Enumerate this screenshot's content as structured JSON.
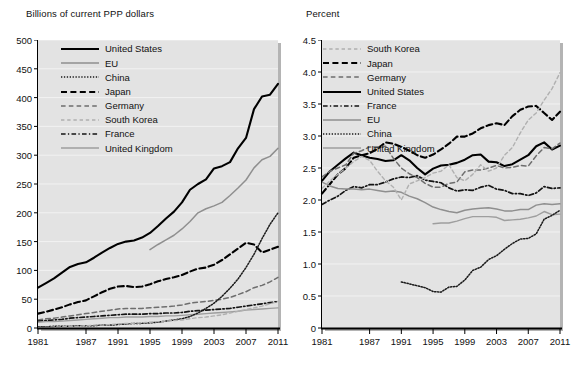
{
  "figure": {
    "background": "#ffffff",
    "plot_background": "#e3e3e3",
    "gridline_color": "#f2f2f2"
  },
  "left": {
    "title": "Billions of current PPP dollars",
    "legend": [
      {
        "label": "United States",
        "style": "solid-thick",
        "color": "#000000"
      },
      {
        "label": "EU",
        "style": "solid-thin",
        "color": "#8c8c8c"
      },
      {
        "label": "China",
        "style": "dotted",
        "color": "#000000"
      },
      {
        "label": "Japan",
        "style": "dashed-thick",
        "color": "#000000"
      },
      {
        "label": "Germany",
        "style": "dashed-thin",
        "color": "#6e6e6e"
      },
      {
        "label": "South Korea",
        "style": "dashed-light",
        "color": "#a8a8a8"
      },
      {
        "label": "France",
        "style": "dash-dot",
        "color": "#000000"
      },
      {
        "label": "United Kingdom",
        "style": "solid-gray",
        "color": "#9a9a9a"
      }
    ]
  },
  "right": {
    "title": "Percent",
    "legend": [
      {
        "label": "South Korea",
        "style": "dashed-light",
        "color": "#a8a8a8"
      },
      {
        "label": "Japan",
        "style": "dashed-thick",
        "color": "#000000"
      },
      {
        "label": "Germany",
        "style": "dashed-thin",
        "color": "#6e6e6e"
      },
      {
        "label": "United States",
        "style": "solid-thick",
        "color": "#000000"
      },
      {
        "label": "France",
        "style": "dash-dot",
        "color": "#000000"
      },
      {
        "label": "EU",
        "style": "solid-thin",
        "color": "#8c8c8c"
      },
      {
        "label": "China",
        "style": "dotted",
        "color": "#000000"
      },
      {
        "label": "United Kingdom",
        "style": "solid-gray",
        "color": "#9a9a9a"
      }
    ]
  },
  "chart_data": [
    {
      "type": "line",
      "panel": "left",
      "title": "Billions of current PPP dollars",
      "xlabel": "",
      "ylabel": "Billions of current PPP dollars",
      "xlim": [
        1981,
        2011
      ],
      "ylim": [
        0,
        500
      ],
      "yticks": [
        0,
        50,
        100,
        150,
        200,
        250,
        300,
        350,
        400,
        450,
        500
      ],
      "xticks": [
        1981,
        1987,
        1991,
        1995,
        1999,
        2003,
        2007,
        2011
      ],
      "xtick_labels": [
        "1981",
        "1987",
        "1991",
        "1995",
        "1999",
        "2003",
        "2007",
        "2011"
      ],
      "ytick_labels": [
        "0",
        "50",
        "100",
        "150",
        "200",
        "250",
        "300",
        "350",
        "400",
        "450",
        "500"
      ],
      "grid": true,
      "legend_position": "upper-left",
      "x": [
        1981,
        1982,
        1983,
        1984,
        1985,
        1986,
        1987,
        1988,
        1989,
        1990,
        1991,
        1992,
        1993,
        1994,
        1995,
        1996,
        1997,
        1998,
        1999,
        2000,
        2001,
        2002,
        2003,
        2004,
        2005,
        2006,
        2007,
        2008,
        2009,
        2010,
        2011
      ],
      "series": [
        {
          "name": "United States",
          "style": "solid-thick",
          "values": [
            70,
            78,
            86,
            96,
            106,
            111,
            114,
            122,
            131,
            139,
            146,
            150,
            152,
            157,
            165,
            177,
            190,
            202,
            218,
            240,
            250,
            258,
            277,
            281,
            288,
            312,
            330,
            380,
            402,
            405,
            424
          ]
        },
        {
          "name": "EU",
          "style": "solid-thin",
          "x_start": 1995,
          "values": [
            null,
            null,
            null,
            null,
            null,
            null,
            null,
            null,
            null,
            null,
            null,
            null,
            null,
            null,
            136,
            145,
            153,
            161,
            172,
            185,
            200,
            207,
            212,
            218,
            230,
            243,
            257,
            278,
            292,
            298,
            312
          ]
        },
        {
          "name": "Japan",
          "style": "dashed-thick",
          "values": [
            25,
            28,
            32,
            36,
            41,
            45,
            48,
            55,
            62,
            68,
            72,
            73,
            71,
            72,
            76,
            81,
            85,
            88,
            92,
            98,
            103,
            105,
            110,
            118,
            128,
            138,
            148,
            145,
            131,
            136,
            141
          ]
        },
        {
          "name": "Germany",
          "style": "dashed-thin",
          "values": [
            14,
            16,
            17,
            19,
            21,
            23,
            25,
            27,
            29,
            31,
            33,
            34,
            34,
            34,
            35,
            36,
            37,
            38,
            40,
            43,
            45,
            46,
            48,
            50,
            53,
            58,
            63,
            70,
            74,
            80,
            88
          ]
        },
        {
          "name": "France",
          "style": "dash-dot",
          "values": [
            12,
            13,
            14,
            15,
            17,
            18,
            19,
            20,
            21,
            22,
            23,
            24,
            24,
            24,
            25,
            25,
            26,
            26,
            27,
            29,
            30,
            31,
            32,
            33,
            34,
            36,
            38,
            40,
            42,
            44,
            46
          ]
        },
        {
          "name": "United Kingdom",
          "style": "solid-gray",
          "values": [
            10,
            11,
            11,
            12,
            13,
            14,
            15,
            16,
            17,
            18,
            18,
            19,
            19,
            19,
            20,
            20,
            21,
            21,
            22,
            23,
            24,
            25,
            26,
            27,
            28,
            29,
            31,
            32,
            33,
            34,
            35
          ]
        },
        {
          "name": "China",
          "style": "dotted",
          "values": [
            2,
            2,
            3,
            3,
            3,
            4,
            4,
            4,
            5,
            5,
            6,
            7,
            8,
            8,
            9,
            10,
            12,
            14,
            16,
            20,
            26,
            34,
            43,
            55,
            69,
            85,
            105,
            128,
            155,
            180,
            200
          ]
        },
        {
          "name": "South Korea",
          "style": "dashed-light",
          "values": [
            1,
            1,
            2,
            2,
            3,
            3,
            4,
            5,
            5,
            6,
            7,
            8,
            8,
            9,
            10,
            11,
            12,
            13,
            14,
            16,
            18,
            19,
            21,
            23,
            26,
            29,
            32,
            35,
            38,
            42,
            46
          ]
        }
      ]
    },
    {
      "type": "line",
      "panel": "right",
      "title": "Percent",
      "xlabel": "",
      "ylabel": "Percent",
      "xlim": [
        1981,
        2011
      ],
      "ylim": [
        0,
        4.5
      ],
      "yticks": [
        0,
        0.5,
        1.0,
        1.5,
        2.0,
        2.5,
        3.0,
        3.5,
        4.0,
        4.5
      ],
      "xticks": [
        1981,
        1987,
        1991,
        1995,
        1999,
        2003,
        2007,
        2011
      ],
      "xtick_labels": [
        "1981",
        "1987",
        "1991",
        "1995",
        "1999",
        "2003",
        "2007",
        "2011"
      ],
      "ytick_labels": [
        "0",
        "0.5",
        "1.0",
        "1.5",
        "2.0",
        "2.5",
        "3.0",
        "3.5",
        "4.0",
        "4.5"
      ],
      "grid": true,
      "legend_position": "upper-left",
      "x": [
        1981,
        1982,
        1983,
        1984,
        1985,
        1986,
        1987,
        1988,
        1989,
        1990,
        1991,
        1992,
        1993,
        1994,
        1995,
        1996,
        1997,
        1998,
        1999,
        2000,
        2001,
        2002,
        2003,
        2004,
        2005,
        2006,
        2007,
        2008,
        2009,
        2010,
        2011
      ],
      "series": [
        {
          "name": "United States",
          "style": "solid-thick",
          "values": [
            2.3,
            2.45,
            2.55,
            2.65,
            2.74,
            2.7,
            2.66,
            2.64,
            2.61,
            2.62,
            2.7,
            2.62,
            2.5,
            2.4,
            2.49,
            2.54,
            2.55,
            2.58,
            2.63,
            2.7,
            2.71,
            2.6,
            2.59,
            2.53,
            2.56,
            2.63,
            2.7,
            2.84,
            2.9,
            2.79,
            2.85
          ]
        },
        {
          "name": "Japan",
          "style": "dashed-thick",
          "values": [
            2.1,
            2.25,
            2.4,
            2.5,
            2.66,
            2.7,
            2.73,
            2.8,
            2.9,
            2.88,
            2.83,
            2.77,
            2.7,
            2.66,
            2.71,
            2.79,
            2.88,
            2.99,
            2.99,
            3.04,
            3.12,
            3.17,
            3.2,
            3.17,
            3.31,
            3.41,
            3.46,
            3.47,
            3.36,
            3.25,
            3.38
          ]
        },
        {
          "name": "Germany",
          "style": "dashed-thin",
          "values": [
            2.36,
            2.45,
            2.5,
            2.55,
            2.73,
            2.77,
            2.83,
            2.83,
            2.84,
            2.65,
            2.5,
            2.41,
            2.35,
            2.26,
            2.2,
            2.2,
            2.26,
            2.28,
            2.44,
            2.47,
            2.47,
            2.5,
            2.54,
            2.5,
            2.51,
            2.54,
            2.53,
            2.69,
            2.82,
            2.8,
            2.89
          ]
        },
        {
          "name": "France",
          "style": "dash-dot",
          "values": [
            1.93,
            2.0,
            2.06,
            2.15,
            2.21,
            2.19,
            2.24,
            2.24,
            2.28,
            2.33,
            2.36,
            2.35,
            2.38,
            2.31,
            2.29,
            2.27,
            2.19,
            2.14,
            2.16,
            2.15,
            2.2,
            2.23,
            2.17,
            2.15,
            2.1,
            2.1,
            2.07,
            2.11,
            2.21,
            2.18,
            2.19
          ]
        },
        {
          "name": "EU",
          "style": "solid-thin",
          "values": [
            2.28,
            2.22,
            2.18,
            2.17,
            2.17,
            2.16,
            2.17,
            2.15,
            2.13,
            2.14,
            2.12,
            2.06,
            2.02,
            1.96,
            1.89,
            1.85,
            1.82,
            1.8,
            1.84,
            1.86,
            1.87,
            1.88,
            1.86,
            1.83,
            1.83,
            1.85,
            1.85,
            1.92,
            1.94,
            1.93,
            1.94
          ]
        },
        {
          "name": "United Kingdom",
          "style": "solid-gray",
          "x_start": 1995,
          "values": [
            null,
            null,
            null,
            null,
            null,
            null,
            null,
            null,
            null,
            null,
            null,
            null,
            null,
            null,
            1.63,
            1.64,
            1.64,
            1.67,
            1.71,
            1.74,
            1.74,
            1.74,
            1.73,
            1.68,
            1.69,
            1.7,
            1.72,
            1.75,
            1.82,
            1.77,
            1.78
          ]
        },
        {
          "name": "China",
          "style": "dotted",
          "x_start": 1991,
          "values": [
            null,
            null,
            null,
            null,
            null,
            null,
            null,
            null,
            null,
            null,
            0.72,
            0.69,
            0.66,
            0.63,
            0.57,
            0.56,
            0.64,
            0.65,
            0.75,
            0.9,
            0.95,
            1.07,
            1.13,
            1.23,
            1.32,
            1.39,
            1.4,
            1.47,
            1.7,
            1.76,
            1.84
          ]
        },
        {
          "name": "South Korea",
          "style": "dashed-light",
          "values": [
            2.18,
            2.3,
            2.4,
            2.5,
            2.6,
            2.68,
            2.62,
            2.45,
            2.3,
            2.2,
            2.0,
            2.25,
            2.3,
            2.35,
            2.42,
            2.45,
            2.55,
            2.35,
            2.3,
            2.4,
            2.55,
            2.45,
            2.5,
            2.7,
            2.82,
            3.05,
            3.25,
            3.36,
            3.56,
            3.74,
            3.99
          ]
        }
      ]
    }
  ]
}
